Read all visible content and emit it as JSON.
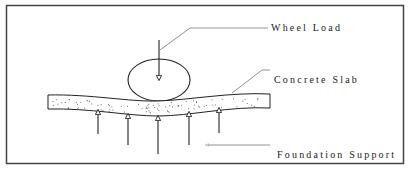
{
  "diagram": {
    "labels": {
      "wheel_load": "Wheel Load",
      "concrete_slab": "Concrete Slab",
      "foundation_support": "Foundation Support"
    },
    "elements": {
      "wheel": "wheel-ellipse",
      "load_arrow": "downward arrow",
      "slab": "deflected concrete slab with aggregate speckles",
      "support_arrows_count": 5
    },
    "colors": {
      "stroke": "#222222",
      "leader": "#777777",
      "frame": "#444444",
      "background": "#ffffff"
    }
  }
}
